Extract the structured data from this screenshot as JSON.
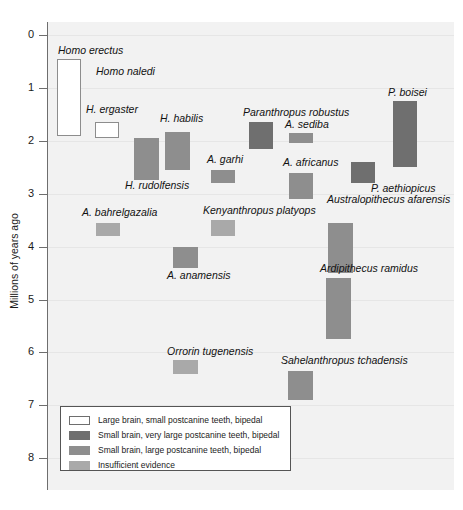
{
  "chart_data": {
    "type": "bar",
    "orientation": "vertical-ranges",
    "title": "",
    "xlabel": "",
    "ylabel": "Millions of years ago",
    "ylim": [
      0,
      8.6
    ],
    "y_inverted": true,
    "grid": true,
    "legend_position": "inside-bottom-left",
    "y_ticks": [
      "0",
      "1",
      "2",
      "3",
      "4",
      "5",
      "6",
      "7",
      "8"
    ],
    "categories": [
      "Homo erectus",
      "Homo naledi",
      "H. ergaster",
      "H. habilis",
      "H. rudolfensis",
      "A. garhi",
      "Paranthropus robustus",
      "A. sediba",
      "A. africanus",
      "P. boisei",
      "P. aethiopicus",
      "Australopithecus afarensis",
      "Kenyanthropus platyops",
      "A. bahrelgazalia",
      "A. anamensis",
      "Ardipithecus ramidus",
      "Orrorin tugenensis",
      "Sahelanthropus tchadensis"
    ],
    "series": [
      {
        "name": "range_start_mya",
        "values": [
          0.45,
          null,
          1.65,
          1.83,
          1.95,
          2.55,
          1.65,
          1.85,
          2.6,
          1.25,
          2.4,
          3.55,
          3.5,
          3.55,
          4.0,
          4.6,
          6.15,
          6.35
        ]
      },
      {
        "name": "range_end_mya",
        "values": [
          1.9,
          null,
          1.95,
          2.55,
          2.75,
          2.8,
          2.15,
          2.05,
          3.1,
          2.5,
          2.8,
          4.5,
          3.8,
          3.8,
          4.4,
          5.75,
          6.4,
          6.9
        ]
      }
    ],
    "points": [
      {
        "label": "Homo erectus",
        "from": 0.45,
        "to": 1.9,
        "category": "large-brain"
      },
      {
        "label": "Homo naledi",
        "from": null,
        "to": null,
        "category": "unplotted"
      },
      {
        "label": "H. ergaster",
        "from": 1.65,
        "to": 1.95,
        "category": "large-brain"
      },
      {
        "label": "H. habilis",
        "from": 1.83,
        "to": 2.55,
        "category": "large-teeth"
      },
      {
        "label": "H. rudolfensis",
        "from": 1.95,
        "to": 2.75,
        "category": "large-teeth"
      },
      {
        "label": "A. garhi",
        "from": 2.55,
        "to": 2.8,
        "category": "large-teeth"
      },
      {
        "label": "Paranthropus robustus",
        "from": 1.65,
        "to": 2.15,
        "category": "very-large-teeth"
      },
      {
        "label": "A. sediba",
        "from": 1.85,
        "to": 2.05,
        "category": "large-teeth"
      },
      {
        "label": "A. africanus",
        "from": 2.6,
        "to": 3.1,
        "category": "large-teeth"
      },
      {
        "label": "P. boisei",
        "from": 1.25,
        "to": 2.5,
        "category": "very-large-teeth"
      },
      {
        "label": "P. aethiopicus",
        "from": 2.4,
        "to": 2.8,
        "category": "very-large-teeth"
      },
      {
        "label": "Australopithecus afarensis",
        "from": 3.55,
        "to": 4.5,
        "category": "large-teeth"
      },
      {
        "label": "Kenyanthropus platyops",
        "from": 3.5,
        "to": 3.8,
        "category": "insufficient"
      },
      {
        "label": "A. bahrelgazalia",
        "from": 3.55,
        "to": 3.8,
        "category": "insufficient"
      },
      {
        "label": "A. anamensis",
        "from": 4.0,
        "to": 4.4,
        "category": "large-teeth"
      },
      {
        "label": "Ardipithecus ramidus",
        "from": 4.6,
        "to": 5.75,
        "category": "large-teeth"
      },
      {
        "label": "Orrorin tugenensis",
        "from": 6.15,
        "to": 6.4,
        "category": "insufficient"
      },
      {
        "label": "Sahelanthropus tchadensis",
        "from": 6.35,
        "to": 6.9,
        "category": "large-teeth"
      }
    ],
    "legend": [
      {
        "key": "large-brain",
        "label": "Large brain, small postcanine teeth, bipedal",
        "color": "#ffffff"
      },
      {
        "key": "very-large-teeth",
        "label": "Small brain, very large postcanine teeth, bipedal",
        "color": "#6f6f6f"
      },
      {
        "key": "large-teeth",
        "label": "Small brain, large postcanine teeth, bipedal",
        "color": "#8e8e8e"
      },
      {
        "key": "insufficient",
        "label": "Insufficient evidence",
        "color": "#a9a9a9"
      }
    ]
  },
  "axis": {
    "ylabel": "Millions of years ago",
    "ticks": [
      "0",
      "1",
      "2",
      "3",
      "4",
      "5",
      "6",
      "7",
      "8"
    ]
  },
  "labels": {
    "homo_erectus": "Homo erectus",
    "homo_naledi": "Homo naledi",
    "h_ergaster": "H. ergaster",
    "h_habilis": "H. habilis",
    "h_rudolfensis": "H. rudolfensis",
    "a_garhi": "A. garhi",
    "p_robustus": "Paranthropus robustus",
    "a_sediba": "A. sediba",
    "a_africanus": "A. africanus",
    "p_boisei": "P. boisei",
    "p_aethiopicus": "P. aethiopicus",
    "a_afarensis": "Australopithecus afarensis",
    "k_platyops": "Kenyanthropus platyops",
    "a_bahrelgazalia": "A. bahrelgazalia",
    "a_anamensis": "A. anamensis",
    "ar_ramidus": "Ardipithecus ramidus",
    "o_tugenensis": "Orrorin tugenensis",
    "s_tchadensis": "Sahelanthropus tchadensis"
  },
  "legend": {
    "rows": [
      "Large brain, small postcanine teeth, bipedal",
      "Small brain, very large postcanine teeth, bipedal",
      "Small brain, large postcanine teeth, bipedal",
      "Insufficient evidence"
    ]
  },
  "colors": {
    "plot_background": "#f2f2f2",
    "gridline": "#e6e6e6",
    "axis": "#6e6e6e",
    "large_brain": "#ffffff",
    "very_large_teeth": "#6f6f6f",
    "large_teeth": "#8e8e8e",
    "insufficient": "#a9a9a9"
  }
}
